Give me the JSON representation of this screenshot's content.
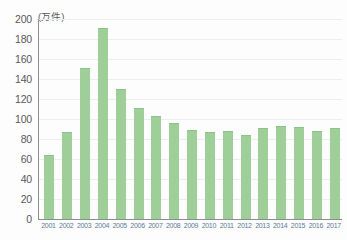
{
  "chart_data": {
    "type": "bar",
    "title": "",
    "subtitle": "",
    "unit_label": "(万件)",
    "xlabel": "",
    "ylabel": "",
    "ylim": [
      0,
      200
    ],
    "ytick_step": 20,
    "yticks": [
      0,
      20,
      40,
      60,
      80,
      100,
      120,
      140,
      160,
      180,
      200
    ],
    "ytick_labels": [
      "0",
      "20",
      "40",
      "60",
      "80",
      "100",
      "120",
      "140",
      "160",
      "180",
      "200"
    ],
    "grid": true,
    "legend": null,
    "legend_position": "none",
    "bar_color": "#9ecf99",
    "axis_color": "#8d8d8d",
    "gridline_color": "#e9eef0",
    "ytick_label_color": "#595959",
    "xtick_label_color": "#5b7a93",
    "categories": [
      "2001",
      "2002",
      "2003",
      "2004",
      "2005",
      "2006",
      "2007",
      "2008",
      "2009",
      "2010",
      "2011",
      "2012",
      "2013",
      "2014",
      "2015",
      "2016",
      "2017"
    ],
    "values": [
      63,
      86,
      150,
      190,
      129,
      110,
      102,
      95,
      88,
      86,
      87,
      83,
      90,
      92,
      91,
      87,
      90
    ]
  }
}
